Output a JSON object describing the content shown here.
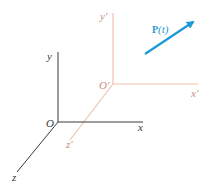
{
  "colors": {
    "world_axes": "#3a3a3a",
    "local_axes": "#f0c2ae",
    "local_label": "#c8907a",
    "vector": "#1d9ad6",
    "world_label": "#3a3a3a"
  },
  "world_frame": {
    "origin_label": "O",
    "x_label": "x",
    "y_label": "y",
    "z_label": "z"
  },
  "local_frame": {
    "origin_label": "O′",
    "x_label": "x′",
    "y_label": "y′",
    "z_label": "z′"
  },
  "vector": {
    "label_bold": "P",
    "label_arg": "(t)"
  }
}
